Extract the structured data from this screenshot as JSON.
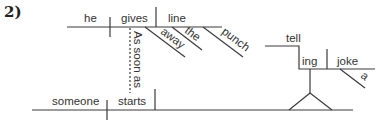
{
  "problem_number": "2)",
  "words": {
    "he": "he",
    "gives": "gives",
    "line": "line",
    "away": "away",
    "the": "the",
    "punch": "punch",
    "as_soon_as": "As soon as",
    "someone": "someone",
    "starts": "starts",
    "tell": "tell",
    "ing": "ing",
    "joke": "joke",
    "a": "a"
  }
}
